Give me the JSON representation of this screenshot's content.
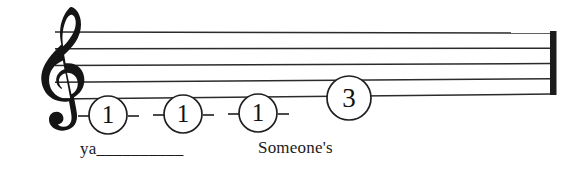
{
  "score": {
    "clef": "treble-clef",
    "staff": {
      "line_count": 5,
      "color": "#2b2b2b",
      "left_x": 55,
      "right_x": 551,
      "left_top_y": 32,
      "left_bottom_y": 99,
      "right_top_y": 33,
      "right_bottom_y": 94
    },
    "barline": {
      "type": "final-thick-barline",
      "color": "#1c1c1c"
    },
    "fingerings": [
      {
        "label": "1",
        "cx": 108,
        "cy": 115,
        "r": 19,
        "dashes": true
      },
      {
        "label": "1",
        "cx": 183,
        "cy": 114,
        "r": 19,
        "dashes": true
      },
      {
        "label": "1",
        "cx": 258,
        "cy": 113,
        "r": 19,
        "dashes": true
      },
      {
        "label": "3",
        "cx": 349,
        "cy": 98,
        "r": 22,
        "dashes": false
      }
    ],
    "lyrics": [
      {
        "text": "ya",
        "extension": "__________"
      },
      {
        "text": "Someone's",
        "extension": ""
      }
    ]
  },
  "colors": {
    "ink": "#1a1a1a",
    "staff_line": "#2b2b2b",
    "background": "#ffffff"
  }
}
